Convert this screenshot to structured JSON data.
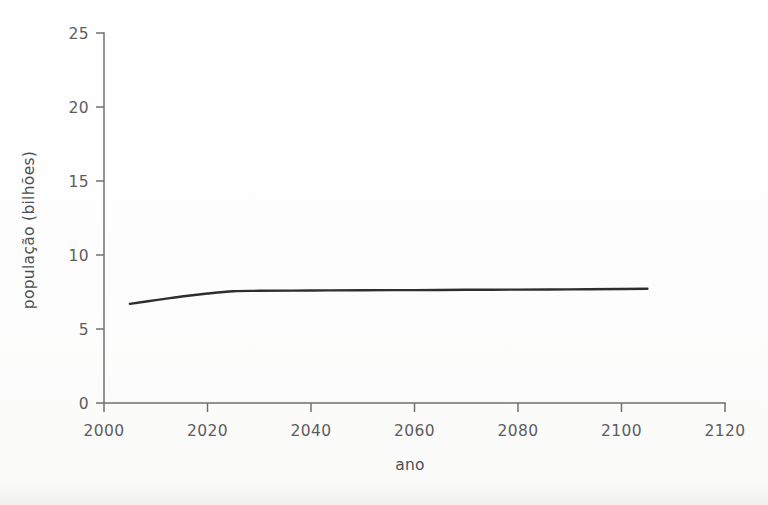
{
  "figure": {
    "background_color": "#fdfdfc",
    "axis_color": "#6f7073",
    "line_color": "#2e2e30",
    "text_color": "#5d5d5f"
  },
  "chart_data": {
    "type": "line",
    "title": "",
    "xlabel": "ano",
    "ylabel": "população (bilhões)",
    "xlim": [
      2000,
      2120
    ],
    "ylim": [
      0,
      25
    ],
    "xticks": [
      2000,
      2020,
      2040,
      2060,
      2080,
      2100,
      2120
    ],
    "xtick_labels": [
      "2000",
      "2020",
      "2040",
      "2060",
      "2080",
      "2100",
      "2120"
    ],
    "yticks": [
      0,
      5,
      10,
      15,
      20,
      25
    ],
    "ytick_labels": [
      "0",
      "5",
      "10",
      "15",
      "20",
      "25"
    ],
    "grid": false,
    "legend": false,
    "series": [
      {
        "name": "população mundial",
        "x": [
          2005,
          2010,
          2015,
          2020,
          2025,
          2030,
          2040,
          2050,
          2060,
          2070,
          2080,
          2090,
          2100,
          2105
        ],
        "values": [
          6.7,
          6.95,
          7.2,
          7.4,
          7.55,
          7.58,
          7.6,
          7.62,
          7.63,
          7.65,
          7.66,
          7.68,
          7.7,
          7.72
        ]
      }
    ]
  }
}
